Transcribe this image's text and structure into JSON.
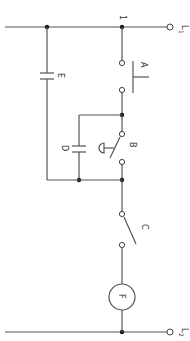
{
  "diagram": {
    "type": "electrical-schematic",
    "orientation": "rotated-90",
    "terminals": [
      {
        "id": "L1",
        "label": "L",
        "subscript": "1"
      },
      {
        "id": "L2",
        "label": "L",
        "subscript": "2"
      }
    ],
    "node_labels": {
      "top_node": "1"
    },
    "components": [
      {
        "id": "A",
        "label": "A",
        "kind": "pushbutton-switch"
      },
      {
        "id": "B",
        "label": "B",
        "kind": "mushroom-head-switch"
      },
      {
        "id": "C",
        "label": "C",
        "kind": "switch"
      },
      {
        "id": "D",
        "label": "D",
        "kind": "capacitor"
      },
      {
        "id": "E",
        "label": "E",
        "kind": "capacitor"
      },
      {
        "id": "F",
        "label": "F",
        "kind": "load-circle"
      }
    ],
    "colors": {
      "wire": "#555555",
      "junction": "#1a1a1a",
      "background": "#ffffff"
    }
  }
}
